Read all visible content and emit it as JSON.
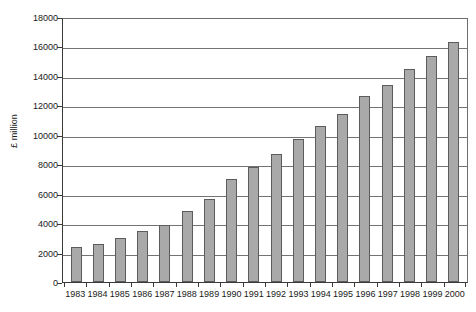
{
  "chart_data": {
    "type": "bar",
    "title": "",
    "subtitle": "",
    "xlabel": "",
    "ylabel": "£ million",
    "ylim": [
      0,
      18000
    ],
    "ytick_step": 2000,
    "yticks": [
      0,
      2000,
      4000,
      6000,
      8000,
      10000,
      12000,
      14000,
      16000,
      18000
    ],
    "ytick_labels": [
      "0",
      "2000",
      "4000",
      "6000",
      "8000",
      "10000",
      "12000",
      "14000",
      "16000",
      "18000"
    ],
    "grid": true,
    "grid_axis": "y",
    "legend": false,
    "legend_position": "none",
    "categories": [
      "1983",
      "1984",
      "1985",
      "1986",
      "1987",
      "1988",
      "1989",
      "1990",
      "1991",
      "1992",
      "1993",
      "1994",
      "1995",
      "1996",
      "1997",
      "1998",
      "1999",
      "2000"
    ],
    "values": [
      2400,
      2550,
      3000,
      3450,
      3880,
      4820,
      5670,
      6970,
      7820,
      8680,
      9720,
      10600,
      11400,
      12620,
      13400,
      14500,
      15350,
      16280
    ],
    "series": [
      {
        "name": "£ million",
        "values": [
          2400,
          2550,
          3000,
          3450,
          3880,
          4820,
          5670,
          6970,
          7820,
          8680,
          9720,
          10600,
          11400,
          12620,
          13400,
          14500,
          15350,
          16280
        ]
      }
    ],
    "bar_color": "#a9a9a9",
    "bar_border_color": "#5c5c5c",
    "gridline_color": "#737373",
    "axis_color": "#3a3a3a",
    "background_color": "#ffffff",
    "text_color": "#1a1a1a"
  }
}
